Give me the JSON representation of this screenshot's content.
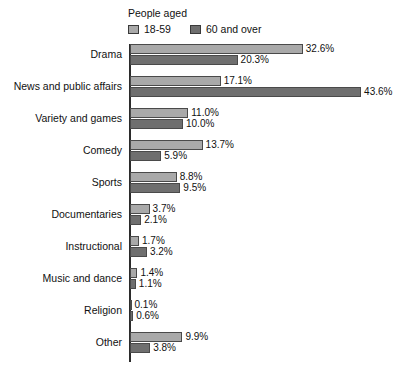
{
  "legend": {
    "title": "People aged",
    "entries": [
      {
        "label": "18-59",
        "color": "#a9a9a9",
        "swatch_name": "legend-swatch-18-59"
      },
      {
        "label": "60 and over",
        "color": "#6f6f6f",
        "swatch_name": "legend-swatch-60-and-over"
      }
    ]
  },
  "chart_data": {
    "type": "bar",
    "orientation": "horizontal",
    "title": "",
    "subtitle": "",
    "xlabel": "",
    "ylabel": "",
    "xlim": [
      0,
      43.6
    ],
    "grid": false,
    "legend_position": "top-left",
    "value_suffix": "%",
    "categories": [
      "Drama",
      "News and public affairs",
      "Variety and games",
      "Comedy",
      "Sports",
      "Documentaries",
      "Instructional",
      "Music and dance",
      "Religion",
      "Other"
    ],
    "series": [
      {
        "name": "18-59",
        "color": "#a9a9a9",
        "values": [
          32.6,
          17.1,
          11.0,
          13.7,
          8.8,
          3.7,
          1.7,
          1.4,
          0.1,
          9.9
        ],
        "labels": [
          "32.6%",
          "17.1%",
          "11.0%",
          "13.7%",
          "8.8%",
          "3.7%",
          "1.7%",
          "1.4%",
          "0.1%",
          "9.9%"
        ]
      },
      {
        "name": "60 and over",
        "color": "#6f6f6f",
        "values": [
          20.3,
          43.6,
          10.0,
          5.9,
          9.5,
          2.1,
          3.2,
          1.1,
          0.6,
          3.8
        ],
        "labels": [
          "20.3%",
          "43.6%",
          "10.0%",
          "5.9%",
          "9.5%",
          "2.1%",
          "3.2%",
          "1.1%",
          "0.6%",
          "3.8%"
        ]
      }
    ]
  }
}
